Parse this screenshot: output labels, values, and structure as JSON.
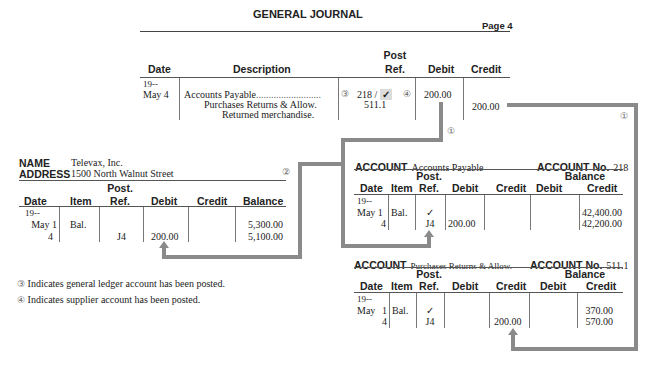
{
  "journal": {
    "title": "GENERAL JOURNAL",
    "page": "Page 4",
    "headers": {
      "date": "Date",
      "description": "Description",
      "post_ref_1": "Post",
      "post_ref_2": "Ref.",
      "debit": "Debit",
      "credit": "Credit"
    },
    "year": "19--",
    "date": "May 4",
    "rows": [
      {
        "description": "Accounts Payable",
        "post_ref": "218 /",
        "check": "✓",
        "debit": "200.00",
        "credit": ""
      },
      {
        "description": "Purchases Returns & Allow.",
        "post_ref": "511.1",
        "debit": "",
        "credit": "200.00"
      },
      {
        "description": "Returned merchandise.",
        "post_ref": "",
        "debit": "",
        "credit": ""
      }
    ],
    "marker_left": "③",
    "marker_right": "④"
  },
  "supplier_ledger": {
    "name_label": "NAME",
    "name": "Televax, Inc.",
    "address_label": "ADDRESS",
    "address": "1500 North Walnut Street",
    "marker": "②",
    "headers": {
      "date": "Date",
      "item": "Item",
      "post_ref_1": "Post.",
      "post_ref_2": "Ref.",
      "debit": "Debit",
      "credit": "Credit",
      "balance": "Balance"
    },
    "year": "19--",
    "rows": [
      {
        "date": "May 1",
        "item": "Bal.",
        "post_ref": "",
        "debit": "",
        "credit": "",
        "balance": "5,300.00"
      },
      {
        "date": "4",
        "item": "",
        "post_ref": "J4",
        "debit": "200.00",
        "credit": "",
        "balance": "5,100.00"
      }
    ]
  },
  "accounts_payable": {
    "account_label": "ACCOUNT",
    "account_name": "Accounts Payable",
    "account_no_label": "ACCOUNT No.",
    "account_no": "218",
    "headers": {
      "date": "Date",
      "item": "Item",
      "post_ref_1": "Post.",
      "post_ref_2": "Ref.",
      "debit": "Debit",
      "credit": "Credit",
      "balance": "Balance",
      "bal_debit": "Debit",
      "bal_credit": "Credit"
    },
    "year": "19--",
    "rows": [
      {
        "date": "May 1",
        "item": "Bal.",
        "post_ref": "✓",
        "debit": "",
        "credit": "",
        "bal_debit": "",
        "bal_credit": "42,400.00"
      },
      {
        "date": "4",
        "item": "",
        "post_ref": "J4",
        "debit": "200.00",
        "credit": "",
        "bal_debit": "",
        "bal_credit": "42,200.00"
      }
    ]
  },
  "purchases_returns": {
    "account_label": "ACCOUNT",
    "account_name": "Purchases Returns & Allow.",
    "account_no_label": "ACCOUNT No.",
    "account_no": "511.1",
    "headers": {
      "date": "Date",
      "item": "Item",
      "post_ref_1": "Post.",
      "post_ref_2": "Ref.",
      "debit": "Debit",
      "credit": "Credit",
      "balance": "Balance",
      "bal_debit": "Debit",
      "bal_credit": "Credit"
    },
    "year": "19--",
    "rows": [
      {
        "date": "May",
        "day": "1",
        "item": "Bal.",
        "post_ref": "✓",
        "debit": "",
        "credit": "",
        "bal_debit": "",
        "bal_credit": "370.00"
      },
      {
        "date": "",
        "day": "4",
        "item": "",
        "post_ref": "J4",
        "debit": "",
        "credit": "200.00",
        "bal_debit": "",
        "bal_credit": "570.00"
      }
    ]
  },
  "markers": {
    "one_a": "①",
    "one_b": "①"
  },
  "notes": [
    {
      "marker": "③",
      "text": "Indicates general ledger account has been posted."
    },
    {
      "marker": "④",
      "text": "Indicates supplier account has been posted."
    }
  ]
}
